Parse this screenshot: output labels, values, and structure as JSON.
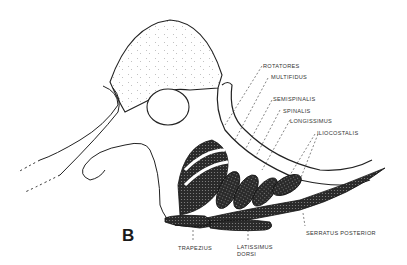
{
  "figure": {
    "panel_label": "B",
    "labels": {
      "rotatores": "ROTATORES",
      "multifidus": "MULTIFIDUS",
      "semispinalis": "SEMISPINALIS",
      "spinalis": "SPINALIS",
      "longissimus": "LONGISSIMUS",
      "iliocostalis": "ILIOCOSTALIS",
      "trapezius": "TRAPEZIUS",
      "latissimus_line1": "LATISSIMUS",
      "latissimus_line2": "DORSI",
      "serratus": "SERRATUS POSTERIOR"
    }
  }
}
